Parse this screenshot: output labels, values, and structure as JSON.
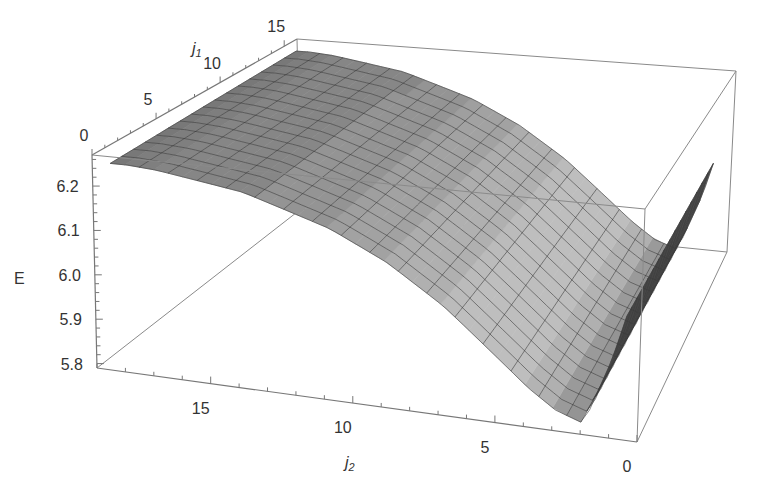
{
  "chart_data": {
    "type": "surface3d",
    "title": "",
    "xlabel": "j1",
    "ylabel": "j2",
    "zlabel": "E",
    "axes": {
      "j1": {
        "label_main": "j",
        "label_sub": "1",
        "range": [
          0,
          16
        ],
        "ticks": [
          0,
          5,
          10,
          15
        ],
        "tick_labels": [
          "0",
          "5",
          "10",
          "15"
        ]
      },
      "j2": {
        "label_main": "j",
        "label_sub": "2",
        "range": [
          0,
          19
        ],
        "ticks": [
          0,
          5,
          10,
          15
        ],
        "tick_labels": [
          "0",
          "5",
          "10",
          "15"
        ]
      },
      "E": {
        "label": "E",
        "range": [
          5.79,
          6.27
        ],
        "ticks": [
          5.8,
          5.9,
          6.0,
          6.1,
          6.2
        ],
        "tick_labels": [
          "5.8",
          "5.9",
          "6.0",
          "6.1",
          "6.2"
        ]
      }
    },
    "surface": {
      "description": "E is nearly independent of j1; high (~6.25) at large j2, decreasing smoothly to a minimum (~5.80) near j2 ~ 2, then rising steeply back to ~6.15 as j2 -> 0.",
      "j2_samples": [
        0,
        1,
        2,
        3,
        4,
        5,
        6,
        7,
        8,
        9,
        10,
        11,
        12,
        13,
        14,
        15,
        16,
        17,
        18
      ],
      "E_profile": [
        6.16,
        5.95,
        5.8,
        5.82,
        5.86,
        5.91,
        5.96,
        6.01,
        6.05,
        6.09,
        6.12,
        6.15,
        6.17,
        6.19,
        6.21,
        6.22,
        6.23,
        6.24,
        6.245
      ],
      "j1_samples": [
        0,
        1,
        2,
        3,
        4,
        5,
        6,
        7,
        8,
        9,
        10,
        11,
        12,
        13,
        14,
        15,
        16
      ],
      "j1_variation": "slight increase of E with j1 (about +0.01 across the range)"
    },
    "style": {
      "colormap": "grayscale",
      "mesh": true,
      "boxed": true
    }
  }
}
